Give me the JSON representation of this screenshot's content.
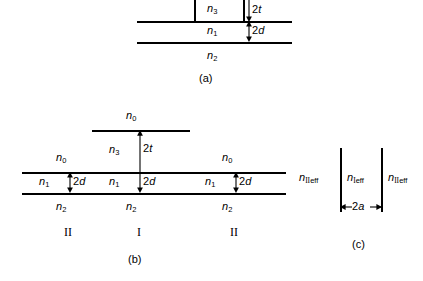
{
  "figure": {
    "panels": [
      {
        "id": "a",
        "caption": "(a)",
        "layers": [
          {
            "name": "n",
            "sub": "3"
          },
          {
            "name": "n",
            "sub": "1"
          },
          {
            "name": "n",
            "sub": "2"
          }
        ],
        "dimensions": [
          {
            "value": "2",
            "symbol": "t"
          },
          {
            "value": "2",
            "symbol": "d"
          }
        ]
      },
      {
        "id": "b",
        "caption": "(b)",
        "stacks": [
          {
            "region": "II",
            "layers": [
              {
                "name": "n",
                "sub": "0"
              },
              {
                "name": "n",
                "sub": "1"
              },
              {
                "name": "n",
                "sub": "2"
              }
            ],
            "dimensions": [
              {
                "value": "2",
                "symbol": "d"
              }
            ]
          },
          {
            "region": "I",
            "layers": [
              {
                "name": "n",
                "sub": "0"
              },
              {
                "name": "n",
                "sub": "3"
              },
              {
                "name": "n",
                "sub": "1"
              },
              {
                "name": "n",
                "sub": "2"
              }
            ],
            "dimensions": [
              {
                "value": "2",
                "symbol": "t"
              },
              {
                "value": "2",
                "symbol": "d"
              }
            ]
          },
          {
            "region": "II",
            "layers": [
              {
                "name": "n",
                "sub": "0"
              },
              {
                "name": "n",
                "sub": "1"
              },
              {
                "name": "n",
                "sub": "2"
              }
            ],
            "dimensions": [
              {
                "value": "2",
                "symbol": "d"
              }
            ]
          }
        ]
      },
      {
        "id": "c",
        "caption": "(c)",
        "regions": [
          {
            "name": "n",
            "roman": "II",
            "eff": "eff"
          },
          {
            "name": "n",
            "roman": "I",
            "eff": "eff"
          },
          {
            "name": "n",
            "roman": "II",
            "eff": "eff"
          }
        ],
        "dimensions": [
          {
            "value": "2",
            "symbol": "a"
          }
        ]
      }
    ]
  },
  "colors": {
    "ink": "#000000",
    "background": "#ffffff"
  }
}
